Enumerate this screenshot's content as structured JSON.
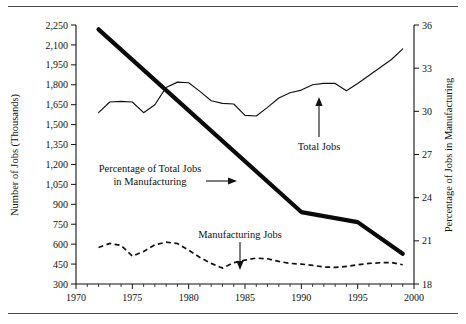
{
  "chart_data": {
    "type": "line",
    "title": "",
    "xlabel": "",
    "ylabel": "Number of Jobs (Thousands)",
    "y2label": "Percentage of Jobs in Manufacturing",
    "grid": false,
    "legend_position": "inline-annotations",
    "xlim": [
      1970,
      2000
    ],
    "xticks": [
      1970,
      1975,
      1980,
      1985,
      1990,
      1995,
      2000
    ],
    "xticklabels": [
      "1970",
      "1975",
      "1980",
      "1985",
      "1990",
      "1995",
      "2000"
    ],
    "x_minor_tick_step": 1,
    "ylim": [
      300,
      2250
    ],
    "yticks": [
      300,
      450,
      600,
      750,
      900,
      1050,
      1200,
      1350,
      1500,
      1650,
      1800,
      1950,
      2100,
      2250
    ],
    "yticklabels": [
      "300",
      "450",
      "600",
      "750",
      "900",
      "1,050",
      "1,200",
      "1,350",
      "1,500",
      "1,650",
      "1,800",
      "1,950",
      "2,100",
      "2,250"
    ],
    "y2lim": [
      18,
      36
    ],
    "y2ticks": [
      18,
      21,
      24,
      27,
      30,
      33,
      36
    ],
    "y2ticklabels": [
      "18",
      "21",
      "24",
      "27",
      "30",
      "33",
      "36"
    ],
    "series": [
      {
        "name": "Total Jobs",
        "axis": "left",
        "style": "solid-thin",
        "color": "#111111",
        "x": [
          1972,
          1973,
          1974,
          1975,
          1976,
          1977,
          1978,
          1979,
          1980,
          1981,
          1982,
          1983,
          1984,
          1985,
          1986,
          1987,
          1988,
          1989,
          1990,
          1991,
          1992,
          1993,
          1994,
          1995,
          1996,
          1997,
          1998,
          1999
        ],
        "values": [
          1590,
          1670,
          1675,
          1670,
          1590,
          1650,
          1780,
          1820,
          1815,
          1750,
          1680,
          1660,
          1655,
          1570,
          1565,
          1630,
          1700,
          1740,
          1760,
          1800,
          1810,
          1810,
          1755,
          1810,
          1870,
          1930,
          1990,
          2070
        ]
      },
      {
        "name": "Manufacturing Jobs",
        "axis": "left",
        "style": "dashed",
        "color": "#111111",
        "x": [
          1972,
          1973,
          1974,
          1975,
          1976,
          1977,
          1978,
          1979,
          1980,
          1981,
          1982,
          1983,
          1984,
          1985,
          1986,
          1987,
          1988,
          1989,
          1990,
          1991,
          1992,
          1993,
          1994,
          1995,
          1996,
          1997,
          1998,
          1999
        ],
        "values": [
          575,
          605,
          590,
          510,
          545,
          595,
          615,
          605,
          555,
          500,
          455,
          420,
          460,
          480,
          495,
          490,
          470,
          455,
          450,
          440,
          428,
          425,
          432,
          445,
          455,
          460,
          462,
          445
        ]
      },
      {
        "name": "Percentage of Total Jobs in Manufacturing",
        "axis": "right",
        "style": "solid-thick",
        "color": "#0a0a0a",
        "x": [
          1972,
          1990,
          1995,
          1999
        ],
        "values": [
          35.7,
          23.0,
          22.3,
          20.1
        ]
      }
    ],
    "annotations": [
      {
        "id": "total-jobs",
        "text": "Total Jobs",
        "points_to": "Total Jobs series near 1992"
      },
      {
        "id": "manufacturing-jobs",
        "text": "Manufacturing Jobs",
        "points_to": "Manufacturing Jobs series near 1986"
      },
      {
        "id": "percentage-label",
        "text_line1": "Percentage of Total Jobs",
        "text_line2": "in Manufacturing",
        "points_to": "Percentage thick line"
      }
    ]
  }
}
